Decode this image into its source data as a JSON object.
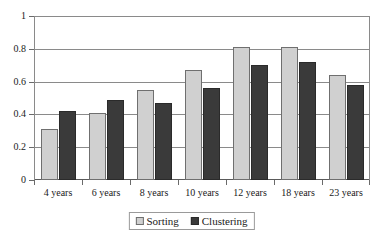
{
  "chart_data": {
    "type": "bar",
    "title": "",
    "subtitle": "",
    "xlabel": "",
    "ylabel": "",
    "categories": [
      "4 years",
      "6 years",
      "8 years",
      "10 years",
      "12 years",
      "18 years",
      "23 years"
    ],
    "series": [
      {
        "name": "Sorting",
        "color": "#d0d0d0",
        "values": [
          0.31,
          0.41,
          0.55,
          0.67,
          0.81,
          0.81,
          0.64
        ]
      },
      {
        "name": "Clustering",
        "color": "#3a3a3a",
        "values": [
          0.42,
          0.49,
          0.47,
          0.56,
          0.7,
          0.72,
          0.58
        ]
      }
    ],
    "ylim": [
      0,
      1
    ],
    "yticks": [
      0,
      0.2,
      0.4,
      0.6,
      0.8,
      1
    ],
    "ytick_labels": [
      "0",
      "0.2",
      "0.4",
      "0.6",
      "0.8",
      "1"
    ],
    "grid": true,
    "grid_axis": "y",
    "legend_position": "bottom-center",
    "legend_entries": [
      "Sorting",
      "Clustering"
    ],
    "annotations": []
  },
  "colors": {
    "sorting": "#d0d0d0",
    "clustering": "#3a3a3a",
    "axis": "#8a8a8a",
    "background": "#ffffff",
    "text": "#1a1a1a"
  }
}
